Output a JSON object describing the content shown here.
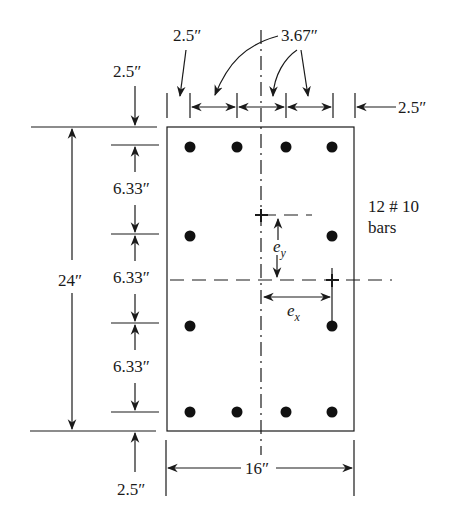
{
  "figure": {
    "section": {
      "width_label": "16″",
      "height_label": "24″"
    },
    "cover": {
      "top": "2.5″",
      "bottom": "2.5″",
      "left": "2.5″",
      "right": "2.5″"
    },
    "spacing": {
      "horizontal": "3.67″",
      "vertical": [
        "6.33″",
        "6.33″",
        "6.33″"
      ]
    },
    "reinforcement": {
      "count_label": "12 # 10",
      "unit_label": "bars"
    },
    "eccentricity": {
      "ex": "e",
      "ex_sub": "x",
      "ey": "e",
      "ey_sub": "y"
    },
    "colors": {
      "ink": "#1a1a1a",
      "background": "#ffffff"
    }
  }
}
